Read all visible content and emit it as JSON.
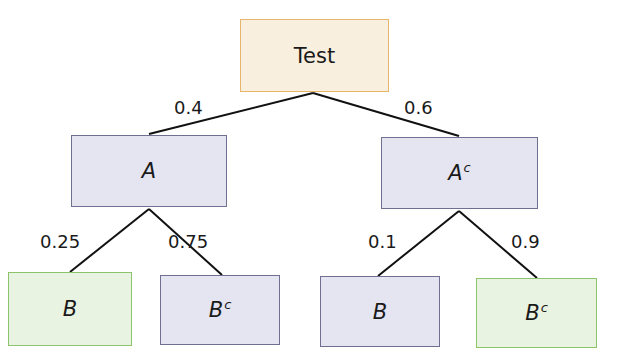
{
  "diagram": {
    "type": "probability-tree",
    "root": {
      "label": "Test"
    },
    "level1": [
      {
        "label": "A",
        "superscript": "",
        "probability": "0.4"
      },
      {
        "label": "A",
        "superscript": "c",
        "probability": "0.6"
      }
    ],
    "level2": [
      {
        "parent": "A",
        "label": "B",
        "superscript": "",
        "probability": "0.25",
        "highlight": "green"
      },
      {
        "parent": "A",
        "label": "B",
        "superscript": "c",
        "probability": "0.75",
        "highlight": "gray"
      },
      {
        "parent": "Ac",
        "label": "B",
        "superscript": "",
        "probability": "0.1",
        "highlight": "gray"
      },
      {
        "parent": "Ac",
        "label": "B",
        "superscript": "c",
        "probability": "0.9",
        "highlight": "green"
      }
    ],
    "colors": {
      "root_fill": "#f8efdf",
      "root_border": "#e8b36a",
      "gray_fill": "#e4e5f0",
      "gray_border": "#6f7090",
      "green_fill": "#e9f3e1",
      "green_border": "#8cc46c"
    }
  }
}
